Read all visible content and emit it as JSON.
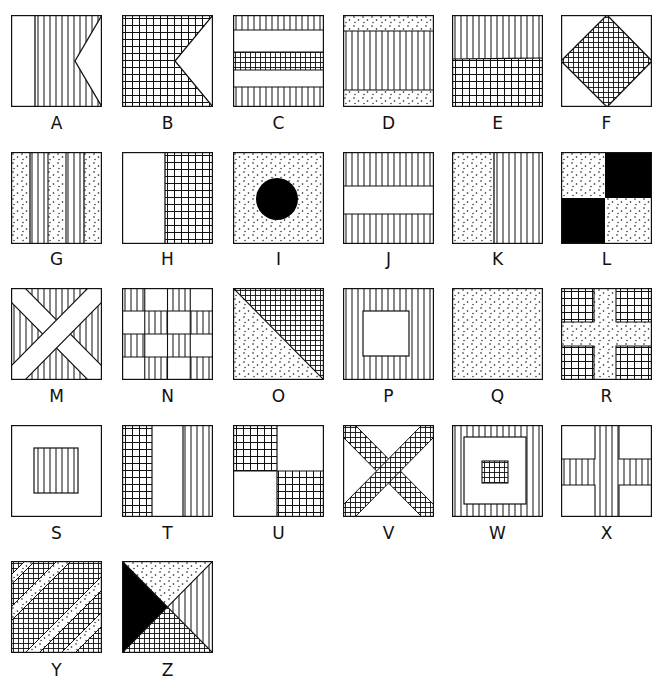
{
  "legend": {
    "vertical_lines": "red",
    "grid": "blue",
    "dots": "yellow",
    "solid": "black",
    "blank": "white"
  },
  "flags": [
    {
      "letter": "A",
      "description": "white hoist, red-hatched swallowtail fly"
    },
    {
      "letter": "B",
      "description": "blue-hatched swallowtail"
    },
    {
      "letter": "C",
      "description": "horizontal stripes: red, white, blue, white, red"
    },
    {
      "letter": "D",
      "description": "yellow top and bottom bands, red middle"
    },
    {
      "letter": "E",
      "description": "red upper half, blue lower half"
    },
    {
      "letter": "F",
      "description": "white field with blue diamond"
    },
    {
      "letter": "G",
      "description": "vertical stripes yellow / red alternating"
    },
    {
      "letter": "H",
      "description": "white hoist, blue fly"
    },
    {
      "letter": "I",
      "description": "yellow field with black circle"
    },
    {
      "letter": "J",
      "description": "red top and bottom, white middle band"
    },
    {
      "letter": "K",
      "description": "yellow hoist, red fly"
    },
    {
      "letter": "L",
      "description": "yellow and black quarters"
    },
    {
      "letter": "M",
      "description": "red field with white saltire"
    },
    {
      "letter": "N",
      "description": "red and white checkerboard 4x4"
    },
    {
      "letter": "O",
      "description": "diagonal: yellow lower-left, blue upper-right"
    },
    {
      "letter": "P",
      "description": "red border with white center square"
    },
    {
      "letter": "Q",
      "description": "solid yellow"
    },
    {
      "letter": "R",
      "description": "blue field with yellow cross"
    },
    {
      "letter": "S",
      "description": "white field with red center square"
    },
    {
      "letter": "T",
      "description": "vertical tricolor blue, white, red"
    },
    {
      "letter": "U",
      "description": "blue and white quarters"
    },
    {
      "letter": "V",
      "description": "white field with blue saltire"
    },
    {
      "letter": "W",
      "description": "red border, white square, blue center"
    },
    {
      "letter": "X",
      "description": "white field with red cross"
    },
    {
      "letter": "Y",
      "description": "yellow and blue diagonal stripes"
    },
    {
      "letter": "Z",
      "description": "four triangles: yellow top, red right, blue bottom, black left"
    }
  ]
}
